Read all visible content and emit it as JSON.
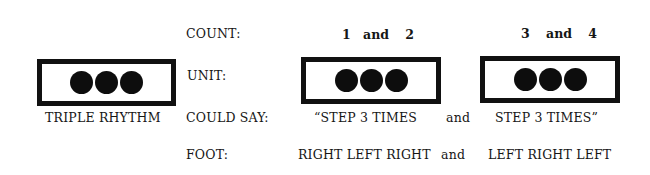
{
  "row_labels": {
    "count": "COUNT:",
    "unit": "UNIT:",
    "could_say": "COULD SAY:",
    "foot": "FOOT:"
  },
  "legend": {
    "caption": "TRIPLE RHYTHM",
    "dots": 3
  },
  "groups": [
    {
      "count": [
        "1",
        "and",
        "2"
      ],
      "dots": 3,
      "say": "“STEP 3 TIMES",
      "foot": "RIGHT LEFT RIGHT"
    },
    {
      "count": [
        "3",
        "and",
        "4"
      ],
      "dots": 3,
      "say": "STEP 3 TIMES”",
      "foot": "LEFT RIGHT LEFT"
    }
  ],
  "connectors": {
    "say_and": "and",
    "foot_and": "and"
  },
  "colors": {
    "ink": "#111111",
    "background": "#ffffff"
  }
}
